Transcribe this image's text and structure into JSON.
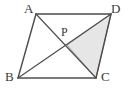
{
  "figure": {
    "type": "geometry-diagram",
    "background_color": "#ffffff",
    "stroke_color": "#4a4a4a",
    "base_stroke_color": "#7a7a7a",
    "shade_fill_color": "#e6e6e6",
    "shade_stroke_color": "#8a8a8a",
    "label_color": "#3a3a3a"
  },
  "vertices": {
    "A": {
      "label": "A",
      "x": 36,
      "y": 14
    },
    "B": {
      "label": "B",
      "x": 18,
      "y": 78
    },
    "C": {
      "label": "C",
      "x": 96,
      "y": 78
    },
    "D": {
      "label": "D",
      "x": 111,
      "y": 14
    },
    "P": {
      "label": "P",
      "x": 67,
      "y": 45
    }
  },
  "edges": [
    {
      "name": "AD",
      "from": "A",
      "to": "D",
      "kind": "side"
    },
    {
      "name": "AB",
      "from": "A",
      "to": "B",
      "kind": "side"
    },
    {
      "name": "BC",
      "from": "B",
      "to": "C",
      "kind": "base"
    },
    {
      "name": "DC",
      "from": "D",
      "to": "C",
      "kind": "side"
    },
    {
      "name": "AC",
      "from": "A",
      "to": "C",
      "kind": "diagonal"
    },
    {
      "name": "BD",
      "from": "B",
      "to": "D",
      "kind": "diagonal"
    }
  ],
  "shaded_region": {
    "name": "triangle-PDC",
    "points": [
      "P",
      "D",
      "C"
    ]
  }
}
